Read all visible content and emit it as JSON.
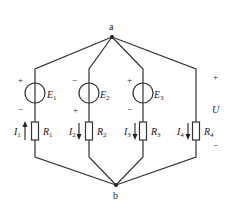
{
  "diagram": {
    "type": "circuit",
    "nodes": {
      "a": {
        "label": "a"
      },
      "b": {
        "label": "b"
      }
    },
    "branches": [
      {
        "source": {
          "name": "E",
          "sub": "1",
          "top_polarity": "+",
          "bottom_polarity": "−"
        },
        "resistor": {
          "name": "R",
          "sub": "1"
        },
        "current": {
          "name": "I",
          "sub": "1",
          "direction": "up"
        }
      },
      {
        "source": {
          "name": "E",
          "sub": "2",
          "top_polarity": "−",
          "bottom_polarity": "+"
        },
        "resistor": {
          "name": "R",
          "sub": "2"
        },
        "current": {
          "name": "I",
          "sub": "2",
          "direction": "down"
        }
      },
      {
        "source": {
          "name": "E",
          "sub": "3",
          "top_polarity": "+",
          "bottom_polarity": "−"
        },
        "resistor": {
          "name": "R",
          "sub": "3"
        },
        "current": {
          "name": "I",
          "sub": "3",
          "direction": "down"
        }
      },
      {
        "resistor": {
          "name": "R",
          "sub": "4"
        },
        "current": {
          "name": "I",
          "sub": "4",
          "direction": "down"
        }
      }
    ],
    "voltage": {
      "name": "U",
      "top_polarity": "+",
      "bottom_polarity": "−"
    }
  }
}
